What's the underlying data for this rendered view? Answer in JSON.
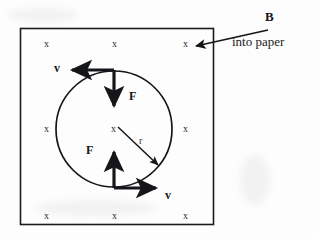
{
  "figure": {
    "background_color": "#fdfdfd",
    "ink_color": "#15161a"
  },
  "field_region": {
    "name": "magnetic-field-box",
    "border_color": "#1a1b20",
    "field_symbol": "x",
    "field_symbol_rows": [
      {
        "row": "top",
        "symbols": [
          "x",
          "x",
          "x"
        ]
      },
      {
        "row": "middle",
        "symbols": [
          "x",
          "x",
          "x"
        ]
      },
      {
        "row": "bottom",
        "symbols": [
          "x",
          "x",
          "x"
        ]
      }
    ]
  },
  "field_label": {
    "symbol": "B",
    "caption": "into paper"
  },
  "orbit": {
    "name": "circular-path",
    "radius_label": "r",
    "center_symbol": "x",
    "stroke_color": "#15161a"
  },
  "vectors": [
    {
      "name": "velocity-top",
      "label": "v",
      "direction": "left",
      "position": "top-of-circle"
    },
    {
      "name": "velocity-bottom",
      "label": "v",
      "direction": "right",
      "position": "bottom-of-circle"
    },
    {
      "name": "force-top",
      "label": "F",
      "direction": "down",
      "position": "top-of-circle"
    },
    {
      "name": "force-bottom",
      "label": "F",
      "direction": "up",
      "position": "bottom-of-circle"
    },
    {
      "name": "radius-vector",
      "label": "r",
      "direction": "down-right",
      "position": "center-to-rim"
    },
    {
      "name": "field-pointer",
      "label": "B",
      "direction": "down-left",
      "position": "to-top-right-x"
    }
  ]
}
